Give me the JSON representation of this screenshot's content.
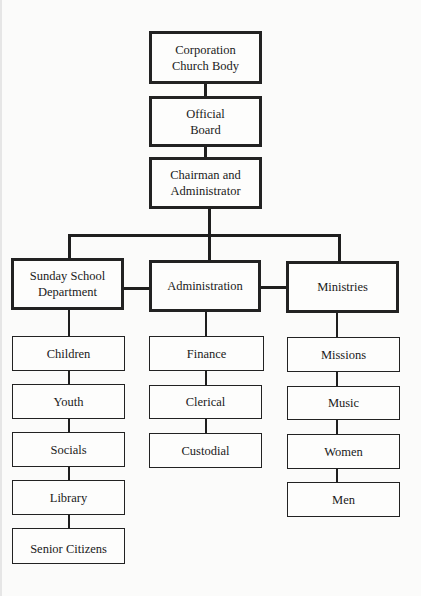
{
  "org_chart": {
    "top": [
      {
        "id": "corporation",
        "label": "Corporation\nChurch Body"
      },
      {
        "id": "official-board",
        "label": "Official\nBoard"
      },
      {
        "id": "chairman",
        "label": "Chairman and\nAdministrator"
      }
    ],
    "departments": [
      {
        "id": "sunday-school",
        "label": "Sunday School\nDepartment",
        "children": [
          "Children",
          "Youth",
          "Socials",
          "Library",
          "Senior Citizens"
        ]
      },
      {
        "id": "administration",
        "label": "Administration",
        "children": [
          "Finance",
          "Clerical",
          "Custodial"
        ]
      },
      {
        "id": "ministries",
        "label": "Ministries",
        "children": [
          "Missions",
          "Music",
          "Women",
          "Men"
        ]
      }
    ]
  },
  "colors": {
    "line": "#1e1e1e",
    "background": "#fbfbfa"
  }
}
